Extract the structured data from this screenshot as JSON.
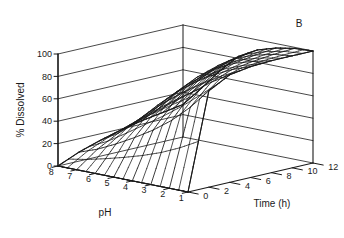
{
  "figure": {
    "panel_label": "B",
    "background_color": "#ffffff",
    "line_color": "#1a1a1a",
    "text_color": "#1a1a1a"
  },
  "chart_data": {
    "type": "line",
    "plot_style": "3d-wireframe-surface",
    "title": "",
    "subtitle": "",
    "panel": "B",
    "xlabel": "pH",
    "ylabel": "Time (h)",
    "zlabel": "% Dissolved",
    "x_ticks": [
      8,
      7,
      6,
      5,
      4,
      3,
      2,
      1
    ],
    "x_tick_labels": [
      "8",
      "7",
      "6",
      "5",
      "4",
      "3",
      "2",
      "1"
    ],
    "xlim": [
      8,
      1
    ],
    "y_ticks": [
      0,
      2,
      4,
      6,
      8,
      10,
      12
    ],
    "y_tick_labels": [
      "0",
      "2",
      "4",
      "6",
      "8",
      "10",
      "12"
    ],
    "ylim": [
      0,
      12
    ],
    "z_ticks": [
      0,
      20,
      40,
      60,
      80,
      100
    ],
    "z_tick_labels": [
      "0",
      "20",
      "40",
      "60",
      "80",
      "100"
    ],
    "zlim": [
      0,
      100
    ],
    "grid": true,
    "legend": "none",
    "x_values_ph": [
      8,
      7,
      6,
      5,
      4,
      3,
      2,
      1
    ],
    "y_values_time": [
      0,
      2,
      4,
      6,
      8,
      10,
      12
    ],
    "z_matrix_rows_ph_cols_time": [
      [
        0,
        8,
        14,
        19,
        23,
        26,
        29
      ],
      [
        0,
        14,
        24,
        32,
        38,
        43,
        47
      ],
      [
        0,
        22,
        37,
        48,
        56,
        62,
        66
      ],
      [
        0,
        31,
        50,
        63,
        72,
        78,
        82
      ],
      [
        0,
        41,
        62,
        75,
        83,
        88,
        91
      ],
      [
        0,
        53,
        74,
        85,
        91,
        94,
        96
      ],
      [
        0,
        68,
        86,
        93,
        96,
        98,
        99
      ],
      [
        0,
        86,
        96,
        99,
        100,
        100,
        100
      ]
    ],
    "annotations": [
      {
        "text": "B",
        "position": "top-right"
      }
    ]
  },
  "axes": {
    "z_axis_title": "% Dissolved",
    "x_axis_title": "pH",
    "y_axis_title": "Time (h)"
  }
}
